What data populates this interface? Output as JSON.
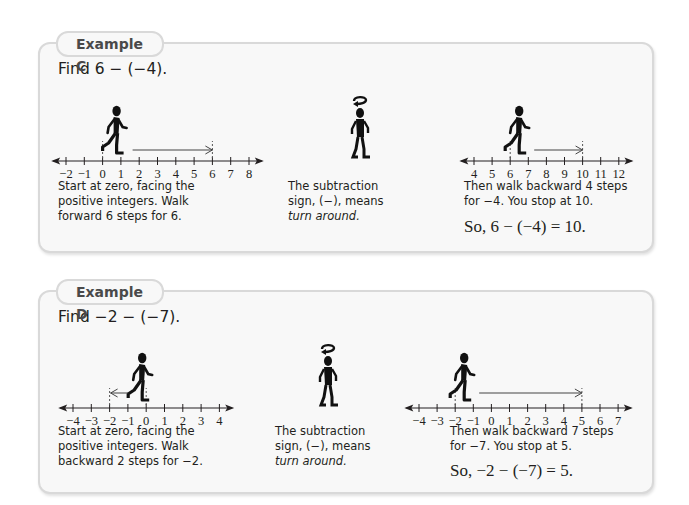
{
  "examples": [
    {
      "label": "Example C",
      "problem": "Find 6 − (−4).",
      "step1": {
        "text_lines": [
          "Start at zero, facing the",
          "positive integers. Walk",
          "forward 6 steps for 6."
        ],
        "number_line": {
          "min": -2,
          "max": 8,
          "ticks": [
            "−2",
            "−1",
            "0",
            "1",
            "2",
            "3",
            "4",
            "5",
            "6",
            "7",
            "8"
          ],
          "start": 0,
          "end": 6,
          "direction": "forward"
        }
      },
      "step2": {
        "text_lines": [
          "The subtraction",
          "sign, (−), means"
        ],
        "italic_line": "turn around."
      },
      "step3": {
        "text_lines": [
          "Then walk backward 4 steps",
          "for −4. You stop at 10."
        ],
        "number_line": {
          "min": 4,
          "max": 12,
          "ticks": [
            "4",
            "5",
            "6",
            "7",
            "8",
            "9",
            "10",
            "11",
            "12"
          ],
          "start": 6,
          "end": 10,
          "direction": "backward"
        }
      },
      "answer": "So, 6 − (−4) = 10."
    },
    {
      "label": "Example D",
      "problem": "Find −2 − (−7).",
      "step1": {
        "text_lines": [
          "Start at zero, facing the",
          "positive integers. Walk",
          "backward 2 steps for −2."
        ],
        "number_line": {
          "min": -4,
          "max": 4,
          "ticks": [
            "−4",
            "−3",
            "−2",
            "−1",
            "0",
            "1",
            "2",
            "3",
            "4"
          ],
          "start": 0,
          "end": -2,
          "direction": "backward"
        }
      },
      "step2": {
        "text_lines": [
          "The subtraction",
          "sign, (−), means"
        ],
        "italic_line": "turn around."
      },
      "step3": {
        "text_lines": [
          "Then walk backward 7 steps",
          "for −7. You stop at 5."
        ],
        "number_line": {
          "min": -4,
          "max": 7,
          "ticks": [
            "−4",
            "−3",
            "−2",
            "−1",
            "0",
            "1",
            "2",
            "3",
            "4",
            "5",
            "6",
            "7"
          ],
          "start": -2,
          "end": 5,
          "direction": "backward"
        }
      },
      "answer": "So, −2 − (−7) = 5."
    }
  ],
  "colors": {
    "box_bg": "#f8f8f8",
    "box_border": "#d9d9d9",
    "text": "#231f20",
    "tab_text": "#4a4a4a"
  }
}
